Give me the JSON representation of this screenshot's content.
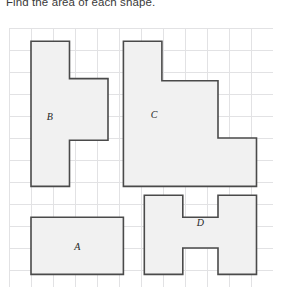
{
  "prompt": {
    "text": "Find the area of each shape."
  },
  "grid": {
    "columns": 12,
    "rows": 12,
    "cell_size_px": 22,
    "line_color": "#e2e2e4",
    "background": "#ffffff"
  },
  "style": {
    "shape_fill": "#f1f1f1",
    "shape_stroke": "#4a4a4a",
    "shape_stroke_width": 1.6,
    "label_color": "#1f1f1f"
  },
  "shapes": [
    {
      "id": "shape-b",
      "label": "B",
      "label_cell": [
        1.85,
        4.1
      ],
      "points": "1,0.6 2.75,0.6 2.75,2.3 4.5,2.3 4.5,5.1 2.75,5.1 2.75,7.2 1,7.2"
    },
    {
      "id": "shape-c",
      "label": "C",
      "label_cell": [
        6.6,
        4.0
      ],
      "points": "5.2,0.6 6.95,0.6 6.95,2.4 9.5,2.4 9.5,5.0 11.25,5.0 11.25,7.2 5.2,7.2"
    },
    {
      "id": "shape-a",
      "label": "A",
      "label_cell": [
        3.1,
        10.0
      ],
      "points": "1,8.6 5.2,8.6 5.2,11.2 1,11.2"
    },
    {
      "id": "shape-d",
      "label": "D",
      "label_cell": [
        8.7,
        8.9
      ],
      "points": "6.15,7.6 7.9,7.6 7.9,8.6 9.5,8.6 9.5,7.6 11.25,7.6 11.25,11.2 9.5,11.2 9.5,10.0 7.9,10.0 7.9,11.2 6.15,11.2"
    }
  ]
}
